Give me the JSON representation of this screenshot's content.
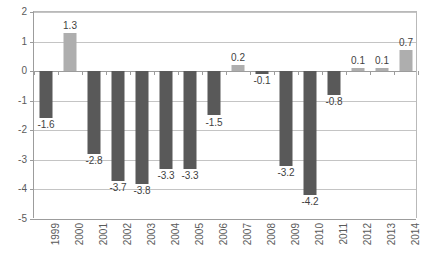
{
  "chart_data": {
    "type": "bar",
    "title": "",
    "subtitle": "",
    "xlabel": "",
    "ylabel": "",
    "categories": [
      "1999",
      "2000",
      "2001",
      "2002",
      "2003",
      "2004",
      "2005",
      "2006",
      "2007",
      "2008",
      "2009",
      "2010",
      "2011",
      "2012",
      "2013",
      "2014"
    ],
    "values": [
      -1.6,
      1.3,
      -2.8,
      -3.7,
      -3.8,
      -3.3,
      -3.3,
      -1.5,
      0.2,
      -0.1,
      -3.2,
      -4.2,
      -0.8,
      0.1,
      0.1,
      0.7
    ],
    "data_labels": [
      "-1.6",
      "1.3",
      "-2.8",
      "-3.7",
      "-3.8",
      "-3.3",
      "-3.3",
      "-1.5",
      "0.2",
      "-0.1",
      "-3.2",
      "-4.2",
      "-0.8",
      "0.1",
      "0.1",
      "0.7"
    ],
    "ylim": [
      -5,
      2
    ],
    "yticks": [
      2,
      1,
      0,
      -1,
      -2,
      -3,
      -4,
      -5
    ],
    "ytick_labels": [
      "2",
      "1",
      "0",
      "-1",
      "-2",
      "-3",
      "-4",
      "-5"
    ],
    "grid": true,
    "legend": "none",
    "colors": {
      "negative_bar": "#595959",
      "positive_bar": "#aeaeae",
      "gridline": "#c4c4c4",
      "axis": "#9c9c9c",
      "tick_text": "#5a5a5a",
      "label_text": "#3f3f3f",
      "background": "#ffffff"
    }
  }
}
